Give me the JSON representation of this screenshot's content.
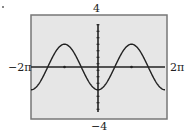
{
  "chart_data": {
    "type": "line",
    "title": "",
    "xlabel": "",
    "ylabel": "",
    "xlim": [
      -6.2832,
      6.2832
    ],
    "ylim": [
      -4,
      4
    ],
    "x_range_labels": {
      "min": "−2π",
      "max": "2π"
    },
    "y_range_labels": {
      "min": "−4",
      "max": "4"
    },
    "grid": false,
    "legend": null,
    "x_ticks": [
      -3.1416,
      3.1416
    ],
    "y_ticks_step": 0.5,
    "background_color": "#e6e6e6",
    "frame_color": "#777777",
    "curve_color": "#222222",
    "series": [
      {
        "name": "y = -A cos(x)",
        "function": "-1.75*cos(x)",
        "amplitude_estimate": 1.75,
        "key_points": [
          {
            "x": -6.2832,
            "y": -1.75
          },
          {
            "x": -4.7124,
            "y": 0
          },
          {
            "x": -3.1416,
            "y": 1.75
          },
          {
            "x": -1.5708,
            "y": 0
          },
          {
            "x": 0,
            "y": -1.75
          },
          {
            "x": 1.5708,
            "y": 0
          },
          {
            "x": 3.1416,
            "y": 1.75
          },
          {
            "x": 4.7124,
            "y": 0
          },
          {
            "x": 6.2832,
            "y": -1.75
          }
        ]
      }
    ]
  },
  "labels": {
    "ymax": "4",
    "ymin": "−4",
    "xmin": "−2π",
    "xmax": "2π"
  }
}
